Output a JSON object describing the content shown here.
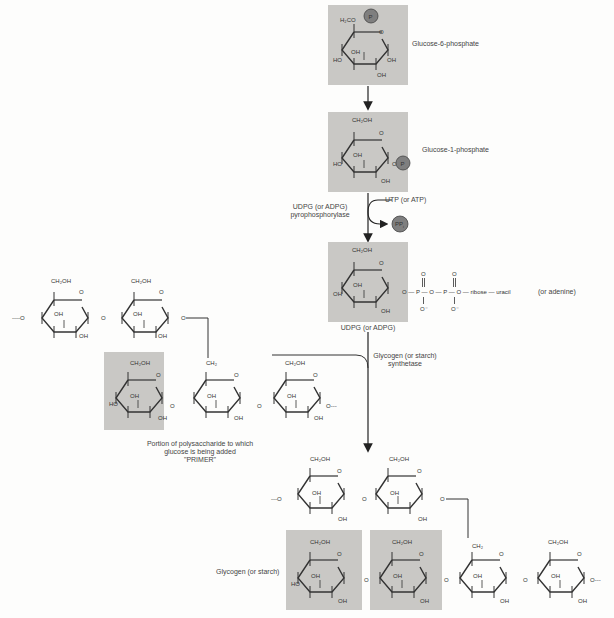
{
  "colors": {
    "shade": "#c9c8c5",
    "phosphate_circle": "#7f7f7f",
    "line": "#333333",
    "background": "#fdfdfc"
  },
  "labels": {
    "g6p": "Glucose-6-phosphate",
    "g1p": "Glucose-1-phosphate",
    "udpg_enzyme_1": "UDPG (or ADPG)",
    "udpg_enzyme_2": "pyrophosphorylase",
    "utp": "UTP (or ATP)",
    "ppi": "PP",
    "ppi_sub": "i",
    "phosphate": "P",
    "udpg": "UDPG (or ADPG)",
    "udpg_chain": "O — P — O — P — O — ribose — uracil",
    "adenine": "(or adenine)",
    "synthetase_1": "Glycogen (or starch)",
    "synthetase_2": "synthetase",
    "primer_1": "Portion of polysaccharide to which",
    "primer_2": "glucose is being added",
    "primer_3": "\"PRIMER\"",
    "glycogen": "Glycogen (or starch)"
  },
  "chem": {
    "ch2oh": "CH₂OH",
    "ch2": "CH₂",
    "h2co": "H₂CO",
    "oh": "OH",
    "ho": "HO",
    "o": "O",
    "o_minus": "O⁻",
    "p": "P"
  }
}
